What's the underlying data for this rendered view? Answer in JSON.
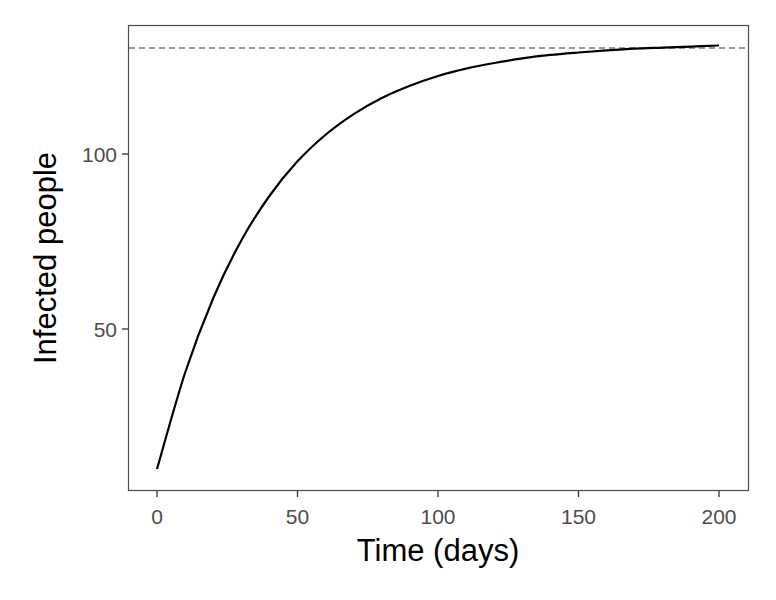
{
  "chart_data": {
    "type": "line",
    "title": "",
    "xlabel": "Time (days)",
    "ylabel": "Infected people",
    "xlim": [
      -10,
      210
    ],
    "ylim": [
      4,
      136
    ],
    "x_ticks": [
      0,
      50,
      100,
      150,
      200
    ],
    "y_ticks": [
      50,
      100
    ],
    "grid": false,
    "legend": null,
    "series": [
      {
        "name": "Infected people",
        "style": "solid",
        "color": "#000000",
        "x": [
          0,
          10,
          20,
          30,
          40,
          50,
          60,
          70,
          80,
          90,
          100,
          110,
          120,
          130,
          140,
          150,
          160,
          170,
          180,
          190,
          200
        ],
        "values": [
          10.0,
          37.5,
          58.8,
          75.3,
          88.0,
          97.9,
          105.5,
          111.4,
          116.0,
          119.5,
          122.3,
          124.4,
          126.0,
          127.3,
          128.3,
          129.0,
          129.6,
          130.1,
          130.4,
          130.7,
          131.0
        ]
      }
    ],
    "reference_lines": [
      {
        "name": "equilibrium",
        "orientation": "horizontal",
        "y": 130.3,
        "style": "dashed",
        "color": "#333333"
      }
    ]
  }
}
